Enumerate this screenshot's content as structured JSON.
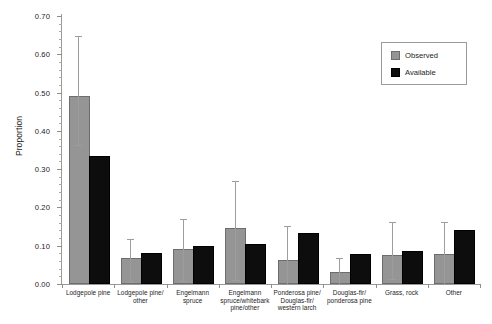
{
  "chart_data": {
    "type": "bar",
    "title": "",
    "xlabel": "",
    "ylabel": "Proportion",
    "ylim": [
      0.0,
      0.7
    ],
    "ytick_step": 0.1,
    "yticks": [
      "0.00",
      "0.10",
      "0.20",
      "0.30",
      "0.40",
      "0.50",
      "0.60",
      "0.70"
    ],
    "grid": false,
    "legend_position": "top-right",
    "categories": [
      "Lodgepole pine",
      "Lodgepole pine/ other",
      "Engelmann spruce",
      "Engelmann spruce/whitebark pine/other",
      "Ponderosa pine/ Douglas-fir/ western larch",
      "Douglas-fir/ ponderosa pine",
      "Grass, rock",
      "Other"
    ],
    "series": [
      {
        "name": "Observed",
        "color": "#959595",
        "values": [
          0.485,
          0.062,
          0.085,
          0.14,
          0.058,
          0.027,
          0.07,
          0.073
        ],
        "error_low": [
          0.362,
          0.005,
          0.008,
          0.01,
          0.0,
          0.0,
          0.012,
          0.0
        ],
        "error_high": [
          0.648,
          0.117,
          0.17,
          0.27,
          0.152,
          0.068,
          0.162,
          0.162
        ]
      },
      {
        "name": "Available",
        "color": "#0d0d0d",
        "values": [
          0.328,
          0.077,
          0.095,
          0.098,
          0.128,
          0.072,
          0.082,
          0.135
        ],
        "error_low": [
          null,
          null,
          null,
          null,
          null,
          null,
          null,
          null
        ],
        "error_high": [
          null,
          null,
          null,
          null,
          null,
          null,
          null,
          null
        ]
      }
    ]
  },
  "legend": {
    "items": [
      {
        "label": "Observed"
      },
      {
        "label": "Available"
      }
    ]
  }
}
